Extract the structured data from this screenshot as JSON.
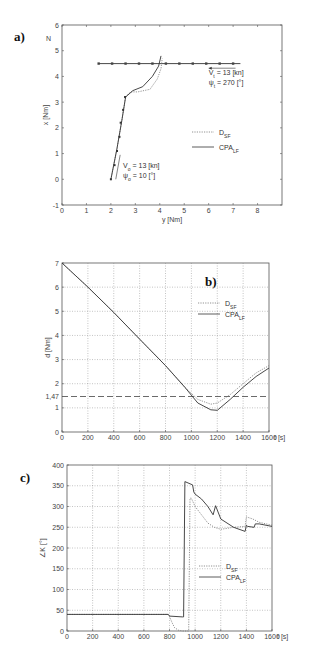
{
  "chart_data": [
    {
      "panel": "a)",
      "type": "line",
      "xlabel": "y [Nm]",
      "ylabel": "x [Nm]",
      "north_label": "N",
      "xlim": [
        0,
        9
      ],
      "ylim": [
        -1,
        6
      ],
      "xticks": [
        "0",
        "1",
        "2",
        "3",
        "4",
        "5",
        "6",
        "7",
        "8"
      ],
      "yticks": [
        "-1",
        "0",
        "1",
        "2",
        "3",
        "4",
        "5",
        "6"
      ],
      "grid": false,
      "legend": [
        {
          "name": "D_SF",
          "style": "dotted"
        },
        {
          "name": "CPA_LF",
          "style": "solid"
        }
      ],
      "annotations": {
        "target_speed": "V",
        "target_speed_sub": "t",
        "target_speed_val": " = 13 [kn]",
        "target_course": "ψ",
        "target_course_sub": "t",
        "target_course_val": " = 270 [°]",
        "own_speed": "V",
        "own_speed_sub": "o",
        "own_speed_val": " = 13 [kn]",
        "own_course": "ψ",
        "own_course_sub": "o",
        "own_course_val": " = 10 [°]"
      },
      "series": [
        {
          "name": "target",
          "style": "solid-marked",
          "x": [
            7.3,
            1.5
          ],
          "y": [
            4.5,
            4.5
          ]
        },
        {
          "name": "D_SF",
          "style": "dotted",
          "x": [
            2.0,
            2.25,
            2.45,
            2.6,
            2.8,
            3.1,
            3.6,
            3.9,
            4.05,
            4.1
          ],
          "y": [
            0.0,
            1.2,
            2.3,
            3.2,
            3.4,
            3.4,
            3.5,
            3.9,
            4.3,
            4.7
          ]
        },
        {
          "name": "CPA_LF",
          "style": "solid",
          "x": [
            2.0,
            2.25,
            2.45,
            2.6,
            2.9,
            3.3,
            3.7,
            3.95,
            4.05
          ],
          "y": [
            0.0,
            1.2,
            2.3,
            3.2,
            3.45,
            3.6,
            4.0,
            4.4,
            4.8
          ]
        }
      ]
    },
    {
      "panel": "b)",
      "type": "line",
      "xlabel": "t [s]",
      "ylabel": "d [Nm]",
      "xlim": [
        0,
        1600
      ],
      "ylim": [
        0,
        7
      ],
      "xticks": [
        "0",
        "200",
        "400",
        "600",
        "800",
        "1000",
        "1200",
        "1400",
        "1600"
      ],
      "yticks": [
        "0",
        "1",
        "1,47",
        "2",
        "3",
        "4",
        "5",
        "6",
        "7"
      ],
      "threshold": {
        "value": 1.47,
        "label": "1,47",
        "style": "dashed"
      },
      "grid": true,
      "legend": [
        {
          "name": "D_SF",
          "style": "dotted"
        },
        {
          "name": "CPA_LF",
          "style": "solid"
        }
      ],
      "series": [
        {
          "name": "D_SF",
          "style": "dotted",
          "x": [
            0,
            200,
            400,
            600,
            800,
            950,
            1050,
            1150,
            1200,
            1300,
            1400,
            1500,
            1600
          ],
          "y": [
            7.0,
            6.0,
            4.95,
            3.85,
            2.75,
            1.85,
            1.35,
            1.15,
            1.2,
            1.55,
            2.0,
            2.45,
            2.75
          ]
        },
        {
          "name": "CPA_LF",
          "style": "solid",
          "x": [
            0,
            200,
            400,
            600,
            800,
            950,
            1050,
            1150,
            1200,
            1300,
            1400,
            1500,
            1600
          ],
          "y": [
            7.0,
            6.0,
            4.95,
            3.85,
            2.75,
            1.85,
            1.2,
            0.92,
            0.9,
            1.35,
            1.85,
            2.3,
            2.65
          ]
        }
      ]
    },
    {
      "panel": "c)",
      "type": "line",
      "xlabel": "t [s]",
      "ylabel": "∠K [°]",
      "xlim": [
        0,
        1600
      ],
      "ylim": [
        0,
        400
      ],
      "xticks": [
        "0",
        "200",
        "400",
        "600",
        "800",
        "1000",
        "1200",
        "1400",
        "1600"
      ],
      "yticks": [
        "0",
        "50",
        "100",
        "150",
        "200",
        "250",
        "300",
        "350",
        "400"
      ],
      "grid": true,
      "legend": [
        {
          "name": "D_SF",
          "style": "dotted"
        },
        {
          "name": "CPA_LF",
          "style": "solid"
        }
      ],
      "series": [
        {
          "name": "D_SF",
          "style": "dotted",
          "x": [
            0,
            790,
            800,
            820,
            840,
            870,
            900,
            950,
            960,
            970,
            1000,
            1050,
            1100,
            1150,
            1200,
            1300,
            1390,
            1400,
            1450,
            1500,
            1600
          ],
          "y": [
            40,
            40,
            35,
            20,
            8,
            2,
            0,
            0,
            320,
            320,
            300,
            280,
            260,
            250,
            245,
            250,
            252,
            275,
            270,
            262,
            255
          ]
        },
        {
          "name": "CPA_LF",
          "style": "solid",
          "x": [
            0,
            790,
            800,
            900,
            910,
            920,
            980,
            990,
            1000,
            1050,
            1100,
            1140,
            1160,
            1200,
            1300,
            1390,
            1400,
            1410,
            1460,
            1470,
            1500,
            1600
          ],
          "y": [
            40,
            40,
            36,
            34,
            34,
            360,
            352,
            335,
            330,
            318,
            300,
            280,
            302,
            270,
            250,
            240,
            255,
            252,
            250,
            258,
            258,
            252
          ]
        }
      ]
    }
  ]
}
